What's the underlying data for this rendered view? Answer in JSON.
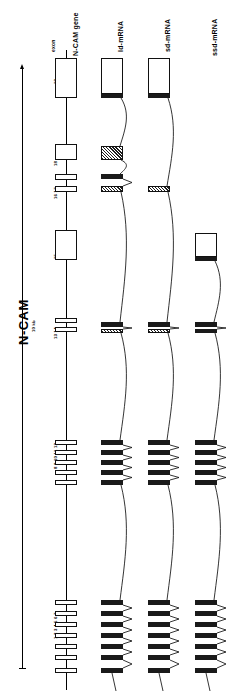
{
  "figure": {
    "title": "N-CAM",
    "scale_label": "10 kb",
    "exon_axis_label": "exon"
  },
  "columns": [
    {
      "id": "gene",
      "label": "N-CAM gene",
      "x": 66
    },
    {
      "id": "ld-mrna",
      "label": "ld-mRNA",
      "x": 112
    },
    {
      "id": "sd-mrna",
      "label": "sd-mRNA",
      "x": 159
    },
    {
      "id": "ssd-mrna",
      "label": "ssd-mRNA",
      "x": 206
    }
  ],
  "exon_labels": [
    {
      "text": "19",
      "y": 70
    },
    {
      "text": "18",
      "y": 152
    },
    {
      "text": "16  17",
      "y": 185
    },
    {
      "text": "15",
      "y": 245
    },
    {
      "text": "13  14",
      "y": 325
    },
    {
      "text": "8  9  10 11 12",
      "y": 455
    },
    {
      "text": "1 2 3 4 5 6 7",
      "y": 625
    }
  ],
  "gene_exons": [
    {
      "name": "exon-19",
      "y": 58,
      "h": 40,
      "w": 22,
      "style": "open"
    },
    {
      "name": "exon-18",
      "y": 144,
      "h": 16,
      "w": 22,
      "style": "open"
    },
    {
      "name": "exon-17",
      "y": 174,
      "h": 6,
      "w": 22,
      "style": "open"
    },
    {
      "name": "exon-16",
      "y": 186,
      "h": 6,
      "w": 22,
      "style": "open"
    },
    {
      "name": "exon-15",
      "y": 230,
      "h": 30,
      "w": 22,
      "style": "open"
    },
    {
      "name": "exon-14",
      "y": 318,
      "h": 5,
      "w": 22,
      "style": "open"
    },
    {
      "name": "exon-13",
      "y": 327,
      "h": 5,
      "w": 22,
      "style": "open"
    },
    {
      "name": "exon-12",
      "y": 440,
      "h": 5,
      "w": 22,
      "style": "open"
    },
    {
      "name": "exon-11",
      "y": 450,
      "h": 5,
      "w": 22,
      "style": "open"
    },
    {
      "name": "exon-10",
      "y": 460,
      "h": 5,
      "w": 22,
      "style": "open"
    },
    {
      "name": "exon-9",
      "y": 470,
      "h": 5,
      "w": 22,
      "style": "open"
    },
    {
      "name": "exon-8",
      "y": 480,
      "h": 5,
      "w": 22,
      "style": "open"
    },
    {
      "name": "exon-7",
      "y": 600,
      "h": 5,
      "w": 22,
      "style": "open"
    },
    {
      "name": "exon-6",
      "y": 611,
      "h": 5,
      "w": 22,
      "style": "open"
    },
    {
      "name": "exon-5",
      "y": 622,
      "h": 5,
      "w": 22,
      "style": "open"
    },
    {
      "name": "exon-4",
      "y": 633,
      "h": 5,
      "w": 22,
      "style": "open"
    },
    {
      "name": "exon-3",
      "y": 644,
      "h": 5,
      "w": 22,
      "style": "open"
    },
    {
      "name": "exon-2",
      "y": 655,
      "h": 5,
      "w": 22,
      "style": "open"
    },
    {
      "name": "exon-1",
      "y": 668,
      "h": 5,
      "w": 22,
      "style": "open"
    }
  ],
  "transcripts": {
    "ld-mrna": {
      "boxes": [
        {
          "name": "exon-19",
          "y": 58,
          "h": 36,
          "style": "open"
        },
        {
          "name": "exon-19b",
          "y": 94,
          "h": 4,
          "style": "fill"
        },
        {
          "name": "exon-18",
          "y": 146,
          "h": 14,
          "style": "hatch"
        },
        {
          "name": "exon-17",
          "y": 174,
          "h": 5,
          "style": "fill"
        },
        {
          "name": "exon-16",
          "y": 186,
          "h": 6,
          "style": "hatch"
        },
        {
          "name": "exon-13",
          "y": 322,
          "h": 5,
          "style": "fill"
        },
        {
          "name": "exon-14",
          "y": 329,
          "h": 4,
          "style": "hatch"
        },
        {
          "name": "exon-12",
          "y": 440,
          "h": 5,
          "style": "fill"
        },
        {
          "name": "exon-11",
          "y": 450,
          "h": 5,
          "style": "fill"
        },
        {
          "name": "exon-10",
          "y": 460,
          "h": 5,
          "style": "fill"
        },
        {
          "name": "exon-9",
          "y": 470,
          "h": 5,
          "style": "fill"
        },
        {
          "name": "exon-8",
          "y": 480,
          "h": 5,
          "style": "fill"
        },
        {
          "name": "exon-7",
          "y": 600,
          "h": 5,
          "style": "fill"
        },
        {
          "name": "exon-6",
          "y": 611,
          "h": 5,
          "style": "fill"
        },
        {
          "name": "exon-5",
          "y": 622,
          "h": 5,
          "style": "fill"
        },
        {
          "name": "exon-4",
          "y": 633,
          "h": 5,
          "style": "fill"
        },
        {
          "name": "exon-3",
          "y": 644,
          "h": 5,
          "style": "fill"
        },
        {
          "name": "exon-2",
          "y": 655,
          "h": 5,
          "style": "fill"
        },
        {
          "name": "exon-1",
          "y": 668,
          "h": 5,
          "style": "fill"
        }
      ]
    },
    "sd-mrna": {
      "boxes": [
        {
          "name": "exon-19",
          "y": 58,
          "h": 36,
          "style": "open"
        },
        {
          "name": "exon-19b",
          "y": 94,
          "h": 4,
          "style": "fill"
        },
        {
          "name": "exon-16",
          "y": 186,
          "h": 6,
          "style": "hatch"
        },
        {
          "name": "exon-13",
          "y": 322,
          "h": 5,
          "style": "fill"
        },
        {
          "name": "exon-14",
          "y": 329,
          "h": 4,
          "style": "hatch"
        },
        {
          "name": "exon-12",
          "y": 440,
          "h": 5,
          "style": "fill"
        },
        {
          "name": "exon-11",
          "y": 450,
          "h": 5,
          "style": "fill"
        },
        {
          "name": "exon-10",
          "y": 460,
          "h": 5,
          "style": "fill"
        },
        {
          "name": "exon-9",
          "y": 470,
          "h": 5,
          "style": "fill"
        },
        {
          "name": "exon-8",
          "y": 480,
          "h": 5,
          "style": "fill"
        },
        {
          "name": "exon-7",
          "y": 600,
          "h": 5,
          "style": "fill"
        },
        {
          "name": "exon-6",
          "y": 611,
          "h": 5,
          "style": "fill"
        },
        {
          "name": "exon-5",
          "y": 622,
          "h": 5,
          "style": "fill"
        },
        {
          "name": "exon-4",
          "y": 633,
          "h": 5,
          "style": "fill"
        },
        {
          "name": "exon-3",
          "y": 644,
          "h": 5,
          "style": "fill"
        },
        {
          "name": "exon-2",
          "y": 655,
          "h": 5,
          "style": "fill"
        },
        {
          "name": "exon-1",
          "y": 668,
          "h": 5,
          "style": "fill"
        }
      ]
    },
    "ssd-mrna": {
      "boxes": [
        {
          "name": "exon-15",
          "y": 233,
          "h": 24,
          "style": "open"
        },
        {
          "name": "exon-15b",
          "y": 257,
          "h": 4,
          "style": "fill"
        },
        {
          "name": "exon-13",
          "y": 322,
          "h": 5,
          "style": "fill"
        },
        {
          "name": "exon-14",
          "y": 329,
          "h": 4,
          "style": "fill"
        },
        {
          "name": "exon-12",
          "y": 440,
          "h": 5,
          "style": "fill"
        },
        {
          "name": "exon-11",
          "y": 450,
          "h": 5,
          "style": "fill"
        },
        {
          "name": "exon-10",
          "y": 460,
          "h": 5,
          "style": "fill"
        },
        {
          "name": "exon-9",
          "y": 470,
          "h": 5,
          "style": "fill"
        },
        {
          "name": "exon-8",
          "y": 480,
          "h": 5,
          "style": "fill"
        },
        {
          "name": "exon-7",
          "y": 600,
          "h": 5,
          "style": "fill"
        },
        {
          "name": "exon-6",
          "y": 611,
          "h": 5,
          "style": "fill"
        },
        {
          "name": "exon-5",
          "y": 622,
          "h": 5,
          "style": "fill"
        },
        {
          "name": "exon-4",
          "y": 633,
          "h": 5,
          "style": "fill"
        },
        {
          "name": "exon-3",
          "y": 644,
          "h": 5,
          "style": "fill"
        },
        {
          "name": "exon-2",
          "y": 655,
          "h": 5,
          "style": "fill"
        },
        {
          "name": "exon-1",
          "y": 668,
          "h": 5,
          "style": "fill"
        }
      ]
    }
  },
  "colors": {
    "ink": "#111111",
    "fill_exon": "#1a1a1a",
    "background": "#ffffff"
  }
}
